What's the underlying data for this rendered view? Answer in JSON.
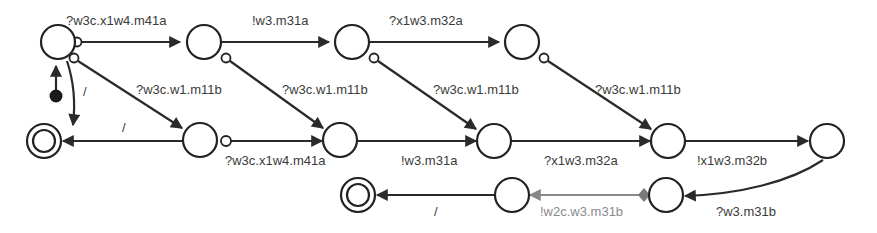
{
  "diagram": {
    "type": "state-machine",
    "colors": {
      "stroke": "#222222",
      "label": "#3a3a3a",
      "gray_edge": "#888888",
      "diamond": "#7a7a7a"
    },
    "nodes": [
      {
        "id": "n0",
        "kind": "initial-target",
        "x": 58,
        "y": 42
      },
      {
        "id": "n1",
        "kind": "state",
        "x": 204,
        "y": 42
      },
      {
        "id": "n2",
        "kind": "state",
        "x": 352,
        "y": 42
      },
      {
        "id": "n3",
        "kind": "state",
        "x": 522,
        "y": 42
      },
      {
        "id": "f1",
        "kind": "final",
        "x": 44,
        "y": 141
      },
      {
        "id": "n4",
        "kind": "state",
        "x": 200,
        "y": 140
      },
      {
        "id": "n5",
        "kind": "state",
        "x": 340,
        "y": 140
      },
      {
        "id": "n6",
        "kind": "state",
        "x": 494,
        "y": 141
      },
      {
        "id": "n7",
        "kind": "state",
        "x": 668,
        "y": 141
      },
      {
        "id": "n8",
        "kind": "state",
        "x": 827,
        "y": 141
      },
      {
        "id": "f2",
        "kind": "final",
        "x": 358,
        "y": 195
      },
      {
        "id": "n9",
        "kind": "state",
        "x": 512,
        "y": 195
      },
      {
        "id": "n10",
        "kind": "state",
        "x": 666,
        "y": 195
      }
    ],
    "edges": {
      "e_n0_n1": {
        "label": "?w3c.x1w4.m41a"
      },
      "e_n1_n2": {
        "label": "!w3.m31a"
      },
      "e_n2_n3": {
        "label": "?x1w3.m32a"
      },
      "e_n0_n4": {
        "label": "?w3c.w1.m11b"
      },
      "e_n1_n5": {
        "label": "?w3c.w1.m11b"
      },
      "e_n2_n6": {
        "label": "?w3c.w1.m11b"
      },
      "e_n3_n7": {
        "label": "?w3c.w1.m11b"
      },
      "e_n0_f1": {
        "label": "/"
      },
      "e_n4_f1": {
        "label": "/"
      },
      "e_n4_n5": {
        "label": "?w3c.x1w4.m41a"
      },
      "e_n5_n6": {
        "label": "!w3.m31a"
      },
      "e_n6_n7": {
        "label": "?x1w3.m32a"
      },
      "e_n7_n8": {
        "label": "!x1w3.m32b"
      },
      "e_n8_n10": {
        "label": "?w3.m31b"
      },
      "e_n10_n9": {
        "label": "!w2c.w3.m31b"
      },
      "e_n9_f2": {
        "label": "/"
      }
    }
  }
}
